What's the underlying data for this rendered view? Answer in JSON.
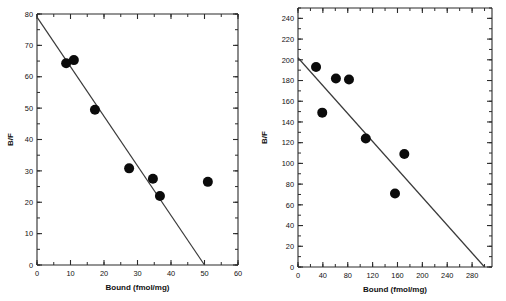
{
  "figure": {
    "background": "#ffffff",
    "point_color": "#0b0b0b",
    "line_color": "#3a3a3a",
    "axis_color": "#2b2b2b"
  },
  "chart_data": [
    {
      "type": "scatter",
      "panel": "left",
      "title": "",
      "xlabel": "Bound (fmol/mg)",
      "ylabel": "B/F",
      "xlim": [
        0,
        60
      ],
      "ylim": [
        0,
        80
      ],
      "xticks": [
        0,
        10,
        20,
        30,
        40,
        50,
        60
      ],
      "xticklabels": [
        "0",
        "10",
        "20",
        "30",
        "40",
        "50",
        "60"
      ],
      "xminor_step": 5,
      "yticks": [
        0,
        10,
        20,
        30,
        40,
        50,
        60,
        70,
        80
      ],
      "yticklabels": [
        "0",
        "10",
        "20",
        "30",
        "40",
        "50",
        "60",
        "70",
        "80"
      ],
      "yminor_step": 5,
      "grid": false,
      "legend": "none",
      "points": [
        {
          "x": 8.7,
          "y": 64.3
        },
        {
          "x": 11.0,
          "y": 65.3
        },
        {
          "x": 17.3,
          "y": 49.5
        },
        {
          "x": 27.5,
          "y": 30.8
        },
        {
          "x": 34.6,
          "y": 27.5
        },
        {
          "x": 36.7,
          "y": 22.0
        },
        {
          "x": 51.0,
          "y": 26.5
        }
      ],
      "fit_line": {
        "x1": 0,
        "y1": 79.0,
        "x2": 50.0,
        "y2": 0.0
      }
    },
    {
      "type": "scatter",
      "panel": "right",
      "title": "",
      "xlabel": "Bound (fmol/mg)",
      "ylabel": "B/F",
      "xlim": [
        0,
        312
      ],
      "ylim": [
        0,
        250
      ],
      "xticks": [
        0,
        40,
        80,
        120,
        160,
        200,
        240,
        280
      ],
      "xticklabels": [
        "0",
        "40",
        "80",
        "120",
        "160",
        "200",
        "240",
        "280"
      ],
      "xminor_step": 20,
      "yticks": [
        0,
        20,
        40,
        60,
        80,
        100,
        120,
        140,
        160,
        180,
        200,
        220,
        240
      ],
      "yticklabels": [
        "0",
        "20",
        "40",
        "60",
        "80",
        "100",
        "120",
        "140",
        "160",
        "180",
        "200",
        "220",
        "240"
      ],
      "yminor_step": 10,
      "grid": false,
      "legend": "none",
      "points": [
        {
          "x": 29,
          "y": 193
        },
        {
          "x": 39,
          "y": 149
        },
        {
          "x": 61,
          "y": 182
        },
        {
          "x": 82,
          "y": 181
        },
        {
          "x": 109,
          "y": 124
        },
        {
          "x": 156,
          "y": 71
        },
        {
          "x": 171,
          "y": 109
        }
      ],
      "fit_line": {
        "x1": 0,
        "y1": 202.0,
        "x2": 300.0,
        "y2": 0.0
      }
    }
  ]
}
